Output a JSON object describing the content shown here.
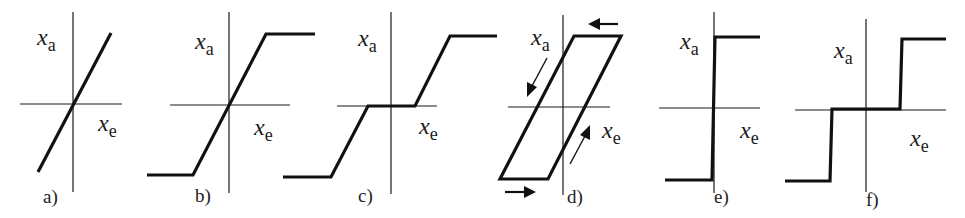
{
  "figure": {
    "axis_labels": {
      "vertical": {
        "var": "x",
        "sub": "a"
      },
      "horizontal": {
        "var": "x",
        "sub": "e"
      }
    },
    "panels": [
      {
        "id": "a",
        "label": "a)",
        "type": "linear"
      },
      {
        "id": "b",
        "label": "b)",
        "type": "saturation"
      },
      {
        "id": "c",
        "label": "c)",
        "type": "dead-zone-with-saturation"
      },
      {
        "id": "d",
        "label": "d)",
        "type": "hysteresis-backlash",
        "arrows": [
          "left-arrow",
          "down-left-arrow",
          "up-right-arrow",
          "right-arrow"
        ]
      },
      {
        "id": "e",
        "label": "e)",
        "type": "ideal-relay"
      },
      {
        "id": "f",
        "label": "f)",
        "type": "relay-with-dead-zone"
      }
    ]
  }
}
